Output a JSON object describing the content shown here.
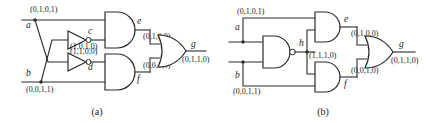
{
  "figure": {
    "panels": [
      {
        "id": "a",
        "caption": "(a)",
        "inputs": [
          {
            "name": "a",
            "value": "(0,1,0,1)"
          },
          {
            "name": "b",
            "value": "(0,0,1,1)"
          }
        ],
        "internal": [
          {
            "name": "c",
            "value": "(1,1,0,0)",
            "gate": "inverter"
          },
          {
            "name": "d",
            "value": "(1,0,1,0)",
            "gate": "inverter"
          },
          {
            "name": "e",
            "value": "(0,1,0,0)",
            "gate": "and"
          },
          {
            "name": "f",
            "value": "(0,0,1,0)",
            "gate": "and"
          }
        ],
        "output": {
          "name": "g",
          "value": "(0,1,1,0)",
          "gate": "or"
        }
      },
      {
        "id": "b",
        "caption": "(b)",
        "inputs": [
          {
            "name": "a",
            "value": "(0,1,0,1)"
          },
          {
            "name": "b",
            "value": "(0,0,1,1)"
          }
        ],
        "internal": [
          {
            "name": "h",
            "value": "(1,1,1,0)",
            "gate": "nand"
          },
          {
            "name": "e",
            "value": "(0,1,0,0)",
            "gate": "and"
          },
          {
            "name": "f",
            "value": "(0,0,1,0)",
            "gate": "and"
          }
        ],
        "output": {
          "name": "g",
          "value": "(0,1,1,0)",
          "gate": "or"
        }
      }
    ]
  },
  "colors": {
    "wire": "#2b2b2b",
    "background": "#ffffff",
    "text": "#1a1a1a"
  }
}
